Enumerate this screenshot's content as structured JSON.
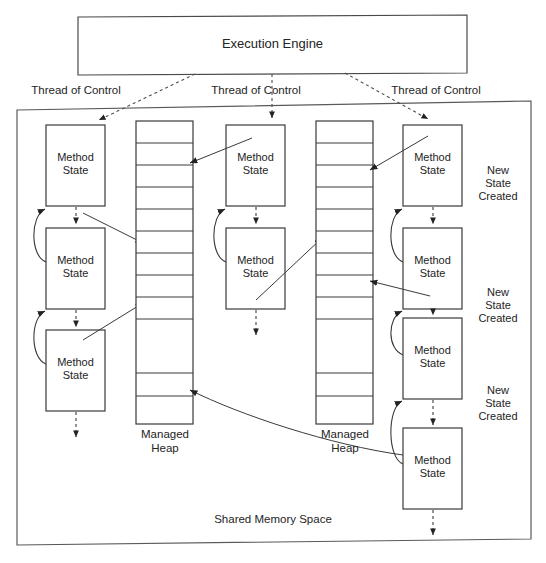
{
  "diagram": {
    "title_box": {
      "label": "Execution Engine",
      "x": 78,
      "y": 16,
      "w": 389,
      "h": 58
    },
    "outer_frame": {
      "label": "Shared Memory Space",
      "x": 16,
      "y": 107,
      "w": 514,
      "h": 438
    },
    "thread_labels": [
      {
        "label": "Thread of Control",
        "x": 22,
        "y": 85
      },
      {
        "label": "Thread of Control",
        "x": 205,
        "y": 85
      },
      {
        "label": "Thread of Control",
        "x": 387,
        "y": 85
      }
    ],
    "method_state_label": "Method\nState",
    "managed_heap_label": "Managed\nHeap",
    "new_state_label": "New\nState\nCreated",
    "shared_memory_label": "Shared Memory Space",
    "columns": [
      {
        "name": "thread-1",
        "boxes": [
          {
            "x": 46,
            "y": 125,
            "w": 59,
            "h": 81
          },
          {
            "x": 46,
            "y": 228,
            "w": 59,
            "h": 81
          },
          {
            "x": 46,
            "y": 330,
            "w": 59,
            "h": 81
          }
        ],
        "heap": {
          "x": 136,
          "y": 121,
          "w": 57,
          "h": 303,
          "dividers": [
            22,
            44,
            66,
            88,
            110,
            132,
            154,
            176,
            198,
            252,
            275
          ]
        }
      },
      {
        "name": "thread-2",
        "boxes": [
          {
            "x": 226,
            "y": 125,
            "w": 59,
            "h": 81
          },
          {
            "x": 226,
            "y": 228,
            "w": 59,
            "h": 81
          }
        ],
        "heap": {
          "x": 316,
          "y": 121,
          "w": 57,
          "h": 303,
          "dividers": [
            22,
            44,
            66,
            88,
            110,
            132,
            154,
            176,
            198,
            252,
            275
          ]
        }
      },
      {
        "name": "thread-3",
        "boxes": [
          {
            "x": 403,
            "y": 125,
            "w": 59,
            "h": 81
          },
          {
            "x": 403,
            "y": 228,
            "w": 59,
            "h": 81
          },
          {
            "x": 403,
            "y": 318,
            "w": 59,
            "h": 81
          },
          {
            "x": 403,
            "y": 428,
            "w": 59,
            "h": 81
          }
        ],
        "heap": null
      }
    ],
    "new_state_positions": [
      {
        "x": 475,
        "y": 165
      },
      {
        "x": 475,
        "y": 287
      },
      {
        "x": 475,
        "y": 385
      }
    ],
    "heap_captions": [
      {
        "x": 136,
        "y": 428
      },
      {
        "x": 316,
        "y": 428
      }
    ],
    "colors": {
      "stroke": "#3a3a3a",
      "text": "#242424",
      "background": "#ffffff",
      "dashed": "#5a5a5a"
    }
  }
}
